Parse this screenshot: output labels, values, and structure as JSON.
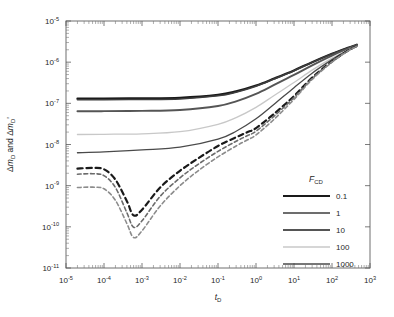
{
  "chart_data": {
    "type": "line",
    "title": "",
    "xlabel": "tD",
    "ylabel": "ΔmD and ΔmD'",
    "xscale": "log",
    "yscale": "log",
    "xlim": [
      1e-05,
      1000.0
    ],
    "ylim": [
      1e-11,
      1e-05
    ],
    "grid": false,
    "legend_position": "bottom-right",
    "legend_title": "FCD",
    "x_tick_labels": [
      "10-5",
      "10-4",
      "10-3",
      "10-2",
      "10-1",
      "100",
      "101",
      "102",
      "103"
    ],
    "x_tick_mantissas": [
      "10",
      "10",
      "10",
      "10",
      "10",
      "10",
      "10",
      "10",
      "10"
    ],
    "x_tick_exponents": [
      "-5",
      "-4",
      "-3",
      "-2",
      "-1",
      "0",
      "1",
      "2",
      "3"
    ],
    "y_tick_mantissas": [
      "10",
      "10",
      "10",
      "10",
      "10",
      "10",
      "10"
    ],
    "y_tick_exponents": [
      "-5",
      "-6",
      "-7",
      "-8",
      "-9",
      "-10",
      "-11"
    ],
    "series": [
      {
        "name": "0.1",
        "legend_label": "0.1",
        "color": "#1a1a1a",
        "width": 2.2,
        "style": "solid",
        "points": [
          [
            2e-05,
            1.3e-07
          ],
          [
            0.0001,
            1.31e-07
          ],
          [
            0.001,
            1.32e-07
          ],
          [
            0.01,
            1.36e-07
          ],
          [
            0.1,
            1.6e-07
          ],
          [
            0.3,
            1.95e-07
          ],
          [
            1.0,
            2.7e-07
          ],
          [
            3.0,
            4e-07
          ],
          [
            10.0,
            6.3e-07
          ],
          [
            30.0,
            1e-06
          ],
          [
            100.0,
            1.6e-06
          ],
          [
            250.0,
            2.2e-06
          ],
          [
            450.0,
            2.65e-06
          ]
        ]
      },
      {
        "name": "1",
        "legend_label": "1",
        "color": "#3d3d3d",
        "width": 1.5,
        "style": "solid",
        "points": [
          [
            2e-05,
            1.22e-07
          ],
          [
            0.0001,
            1.23e-07
          ],
          [
            0.001,
            1.24e-07
          ],
          [
            0.01,
            1.28e-07
          ],
          [
            0.1,
            1.52e-07
          ],
          [
            0.3,
            1.86e-07
          ],
          [
            1.0,
            2.6e-07
          ],
          [
            3.0,
            3.9e-07
          ],
          [
            10.0,
            6.2e-07
          ],
          [
            30.0,
            9.9e-07
          ],
          [
            100.0,
            1.58e-06
          ],
          [
            250.0,
            2.18e-06
          ],
          [
            450.0,
            2.62e-06
          ]
        ]
      },
      {
        "name": "10",
        "legend_label": "10",
        "color": "#555555",
        "width": 1.9,
        "style": "solid",
        "points": [
          [
            2e-05,
            6.4e-08
          ],
          [
            0.0001,
            6.45e-08
          ],
          [
            0.001,
            6.55e-08
          ],
          [
            0.01,
            6.9e-08
          ],
          [
            0.1,
            8.6e-08
          ],
          [
            0.3,
            1.12e-07
          ],
          [
            1.0,
            1.7e-07
          ],
          [
            3.0,
            2.8e-07
          ],
          [
            10.0,
            4.9e-07
          ],
          [
            30.0,
            8.4e-07
          ],
          [
            100.0,
            1.45e-06
          ],
          [
            250.0,
            2.08e-06
          ],
          [
            450.0,
            2.58e-06
          ]
        ]
      },
      {
        "name": "100",
        "legend_label": "100",
        "color": "#c8c8c8",
        "width": 1.3,
        "style": "solid",
        "points": [
          [
            2e-05,
            1.75e-08
          ],
          [
            0.0001,
            1.77e-08
          ],
          [
            0.001,
            1.82e-08
          ],
          [
            0.01,
            2.05e-08
          ],
          [
            0.1,
            3.1e-08
          ],
          [
            0.3,
            4.5e-08
          ],
          [
            1.0,
            8e-08
          ],
          [
            3.0,
            1.55e-07
          ],
          [
            10.0,
            3.2e-07
          ],
          [
            30.0,
            6.4e-07
          ],
          [
            100.0,
            1.25e-06
          ],
          [
            250.0,
            1.95e-06
          ],
          [
            450.0,
            2.52e-06
          ]
        ]
      },
      {
        "name": "1000",
        "legend_label": "1000",
        "color": "#4a4a4a",
        "width": 1.3,
        "style": "solid",
        "points": [
          [
            2e-05,
            6.3e-09
          ],
          [
            0.0001,
            6.6e-09
          ],
          [
            0.001,
            7.4e-09
          ],
          [
            0.01,
            8.6e-09
          ],
          [
            0.1,
            1.35e-08
          ],
          [
            0.3,
            2.1e-08
          ],
          [
            1.0,
            4.2e-08
          ],
          [
            3.0,
            9.5e-08
          ],
          [
            10.0,
            2.4e-07
          ],
          [
            30.0,
            5.4e-07
          ],
          [
            100.0,
            1.15e-06
          ],
          [
            250.0,
            1.9e-06
          ],
          [
            450.0,
            2.5e-06
          ]
        ]
      },
      {
        "name": "0.1-derivative",
        "legend_label": "",
        "color": "#1a1a1a",
        "width": 2.2,
        "style": "dashed",
        "points": [
          [
            2e-05,
            2.6e-09
          ],
          [
            5e-05,
            2.7e-09
          ],
          [
            0.0001,
            2.5e-09
          ],
          [
            0.0002,
            1.4e-09
          ],
          [
            0.0004,
            4.2e-10
          ],
          [
            0.0006,
            1.9e-10
          ],
          [
            0.001,
            2.6e-10
          ],
          [
            0.003,
            9e-10
          ],
          [
            0.01,
            2.3e-09
          ],
          [
            0.03,
            4.6e-09
          ],
          [
            0.1,
            9.2e-09
          ],
          [
            0.3,
            1.5e-08
          ],
          [
            0.6,
            2e-08
          ],
          [
            1.0,
            2.5e-08
          ],
          [
            3.0,
            5.6e-08
          ],
          [
            10.0,
            1.5e-07
          ],
          [
            30.0,
            4.2e-07
          ],
          [
            100.0,
            1.05e-06
          ],
          [
            250.0,
            1.85e-06
          ],
          [
            450.0,
            2.48e-06
          ]
        ]
      },
      {
        "name": "1-derivative",
        "legend_label": "",
        "color": "#6b6b6b",
        "width": 1.6,
        "style": "dashed",
        "points": [
          [
            2e-05,
            1.9e-09
          ],
          [
            5e-05,
            1.95e-09
          ],
          [
            0.0001,
            1.75e-09
          ],
          [
            0.0002,
            9e-10
          ],
          [
            0.0004,
            2.2e-10
          ],
          [
            0.0006,
            9.8e-11
          ],
          [
            0.001,
            1.4e-10
          ],
          [
            0.003,
            5.5e-10
          ],
          [
            0.01,
            1.55e-09
          ],
          [
            0.03,
            3.3e-09
          ],
          [
            0.1,
            6.8e-09
          ],
          [
            0.3,
            1.2e-08
          ],
          [
            0.6,
            1.65e-08
          ],
          [
            1.0,
            2.1e-08
          ],
          [
            3.0,
            4.9e-08
          ],
          [
            10.0,
            1.38e-07
          ],
          [
            30.0,
            4e-07
          ],
          [
            100.0,
            1.02e-06
          ],
          [
            250.0,
            1.83e-06
          ],
          [
            450.0,
            2.46e-06
          ]
        ]
      },
      {
        "name": "10-derivative",
        "legend_label": "",
        "color": "#8c8c8c",
        "width": 1.6,
        "style": "dashed",
        "points": [
          [
            2e-05,
            9e-10
          ],
          [
            5e-05,
            9.2e-10
          ],
          [
            0.0001,
            8.4e-10
          ],
          [
            0.0002,
            4.4e-10
          ],
          [
            0.0004,
            1.2e-10
          ],
          [
            0.0006,
            5.5e-11
          ],
          [
            0.001,
            8e-11
          ],
          [
            0.003,
            3.2e-10
          ],
          [
            0.01,
            1e-09
          ],
          [
            0.03,
            2.3e-09
          ],
          [
            0.1,
            5e-09
          ],
          [
            0.3,
            9.2e-09
          ],
          [
            0.6,
            1.3e-08
          ],
          [
            1.0,
            1.7e-08
          ],
          [
            3.0,
            4.1e-08
          ],
          [
            10.0,
            1.25e-07
          ],
          [
            30.0,
            3.8e-07
          ],
          [
            100.0,
            1e-06
          ],
          [
            250.0,
            1.81e-06
          ],
          [
            450.0,
            2.44e-06
          ]
        ]
      }
    ]
  },
  "legend": {
    "title_main": "F",
    "title_sub": "CD",
    "entries": [
      {
        "label": "0.1",
        "color": "#1a1a1a",
        "width": 2.2
      },
      {
        "label": "1",
        "color": "#3d3d3d",
        "width": 1.4
      },
      {
        "label": "10",
        "color": "#555555",
        "width": 2.0
      },
      {
        "label": "100",
        "color": "#c8c8c8",
        "width": 1.3
      },
      {
        "label": "1000",
        "color": "#4a4a4a",
        "width": 1.7
      }
    ]
  },
  "axes": {
    "y_title_delta1": "Δ",
    "y_title_m1": "m",
    "y_title_sub1": "D",
    "y_title_and": " and ",
    "y_title_delta2": "Δ",
    "y_title_m2": "m",
    "y_title_sub2": "D",
    "y_title_prime": "'",
    "x_title_main": "t",
    "x_title_sub": "D"
  }
}
